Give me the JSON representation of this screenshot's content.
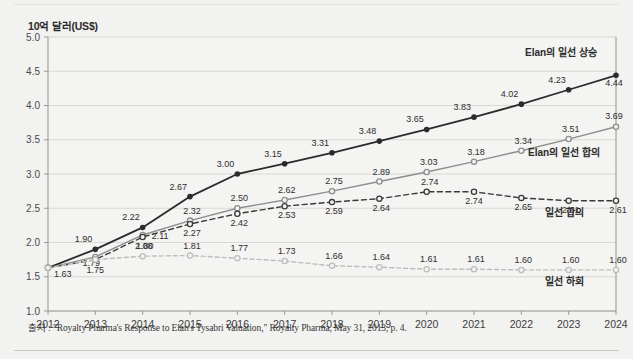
{
  "axis_title": "10억 달러(US$)",
  "source_note": "출처 : \"Royalty Pharma's Response to Elan's Tysabri Valuation,\" Royalty Pharma, May 31, 2013, p. 4.",
  "colors": {
    "background": "#f2f2f0",
    "plot_background": "#f4f4f2",
    "grid": "#d8d8d5",
    "axis": "#9a9a97",
    "series_upside": "#2b2b2b",
    "series_elan_consensus": "#8e8e8e",
    "series_consensus": "#3a3a3a",
    "series_downside": "#bdbdbd",
    "text": "#2e2e2e",
    "rule": "#c9c9c6"
  },
  "chart_data": {
    "type": "line",
    "title": "",
    "subtitle": "",
    "xlabel": "",
    "ylabel": "10억 달러(US$)",
    "ylim": [
      1.0,
      5.0
    ],
    "yticks": [
      "1.0",
      "1.5",
      "2.0",
      "2.5",
      "3.0",
      "3.5",
      "4.0",
      "4.5",
      "5.0"
    ],
    "ytick_values": [
      1.0,
      1.5,
      2.0,
      2.5,
      3.0,
      3.5,
      4.0,
      4.5,
      5.0
    ],
    "grid": true,
    "legend_position": "inline-right",
    "categories": [
      "2012",
      "2013",
      "2014",
      "2015",
      "2016",
      "2017",
      "2018",
      "2019",
      "2020",
      "2021",
      "2022",
      "2023",
      "2024"
    ],
    "series": [
      {
        "name": "Elan의 일선 상승",
        "style": "solid",
        "color": "#2b2b2b",
        "marker": "filled-circle",
        "values": [
          1.63,
          1.9,
          2.22,
          2.67,
          3.0,
          3.15,
          3.31,
          3.48,
          3.65,
          3.83,
          4.02,
          4.23,
          4.44
        ],
        "labels": [
          "1.63",
          "1.90",
          "2.22",
          "2.67",
          "3.00",
          "3.15",
          "3.31",
          "3.48",
          "3.65",
          "3.83",
          "4.02",
          "4.23",
          "4.44"
        ]
      },
      {
        "name": "Elan의 일선 합의",
        "style": "solid",
        "color": "#8e8e8e",
        "marker": "open-circle",
        "values": [
          1.63,
          1.79,
          2.11,
          2.32,
          2.5,
          2.62,
          2.75,
          2.89,
          3.03,
          3.18,
          3.34,
          3.51,
          3.69
        ],
        "labels": [
          "1.63",
          "1.79",
          "2.11",
          "2.32",
          "2.50",
          "2.62",
          "2.75",
          "2.89",
          "3.03",
          "3.18",
          "3.34",
          "3.51",
          "3.69"
        ]
      },
      {
        "name": "일선 합의",
        "style": "dashed",
        "color": "#3a3a3a",
        "marker": "open-circle",
        "values": [
          1.63,
          1.75,
          2.08,
          2.27,
          2.42,
          2.53,
          2.59,
          2.64,
          2.74,
          2.74,
          2.65,
          2.61,
          2.61
        ],
        "labels": [
          "1.63",
          "1.75",
          "2.08",
          "2.27",
          "2.42",
          "2.53",
          "2.59",
          "2.64",
          "2.74",
          "2.74",
          "2.65",
          "2.61",
          "2.61"
        ]
      },
      {
        "name": "일선 하회",
        "style": "dashed",
        "color": "#bdbdbd",
        "marker": "open-circle",
        "values": [
          1.63,
          1.75,
          1.8,
          1.81,
          1.77,
          1.73,
          1.66,
          1.64,
          1.61,
          1.61,
          1.6,
          1.6,
          1.6
        ],
        "labels": [
          "1.63",
          "1.75",
          "1.80",
          "1.81",
          "1.77",
          "1.73",
          "1.66",
          "1.64",
          "1.61",
          "1.61",
          "1.60",
          "1.60",
          "1.60"
        ]
      }
    ],
    "annotations": [
      {
        "text": "Elan의 일선 상승",
        "series": 0
      },
      {
        "text": "Elan의 일선 합의",
        "series": 1
      },
      {
        "text": "일선 합의",
        "series": 2
      },
      {
        "text": "일선 하회",
        "series": 3
      }
    ]
  }
}
